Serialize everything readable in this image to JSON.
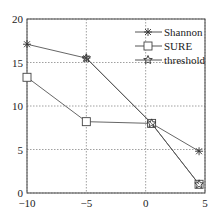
{
  "chart_data": {
    "type": "line",
    "title": "",
    "xlabel": "",
    "ylabel": "",
    "xlim": [
      -10,
      5
    ],
    "ylim": [
      0,
      20
    ],
    "grid": true,
    "legend_position": "upper right",
    "x_ticks": [
      "-10",
      "-5",
      "0",
      "5"
    ],
    "y_ticks": [
      "0",
      "5",
      "10",
      "15",
      "20"
    ],
    "series": [
      {
        "name": "Shannon",
        "marker": "asterisk",
        "x": [
          -10,
          -5,
          0.5,
          4.5
        ],
        "values": [
          17.1,
          15.5,
          8.0,
          4.8
        ]
      },
      {
        "name": "SURE",
        "marker": "square",
        "x": [
          -10,
          -5,
          0.5,
          4.5
        ],
        "values": [
          13.3,
          8.2,
          8.0,
          1.0
        ]
      },
      {
        "name": "threshold",
        "marker": "star",
        "x": [
          -5,
          0.5,
          4.5
        ],
        "values": [
          15.5,
          8.0,
          1.0
        ]
      }
    ]
  },
  "legend": {
    "items": [
      "Shannon",
      "SURE",
      "threshold"
    ]
  },
  "axes": {
    "x_ticks": [
      "-10",
      "-5",
      "0",
      "5"
    ],
    "y_ticks": [
      "0",
      "5",
      "10",
      "15",
      "20"
    ]
  }
}
